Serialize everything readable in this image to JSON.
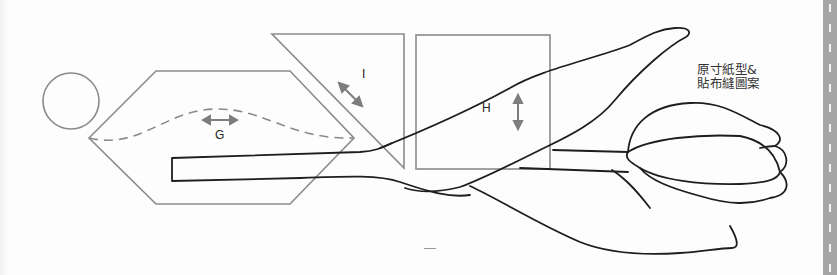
{
  "page": {
    "type": "sewing pattern page (full-size template)",
    "caption_lines": [
      "原寸紙型&",
      "貼布縫圖案"
    ]
  },
  "pieces": [
    {
      "id": "circle",
      "shape": "circle",
      "label": ""
    },
    {
      "id": "G",
      "shape": "hexagon",
      "label": "G",
      "grain_arrow": "horizontal",
      "has_dashed_curve": true
    },
    {
      "id": "I",
      "shape": "triangle",
      "label": "I",
      "grain_arrow": "diagonal"
    },
    {
      "id": "H",
      "shape": "square",
      "label": "H",
      "grain_arrow": "vertical"
    }
  ],
  "applique": {
    "motif": "tulip",
    "parts": [
      "stem",
      "upper-leaf",
      "lower-leaf",
      "flower-bud"
    ]
  },
  "colors": {
    "pattern_line": "#8a8a8a",
    "applique_line": "#1e1e1e",
    "arrow": "#7d7d7d",
    "side_strip": "#a6a6a6",
    "background": "#fdfdfd"
  },
  "side_strip": {
    "style": "dashed-cut-line",
    "dash_count": 14
  }
}
